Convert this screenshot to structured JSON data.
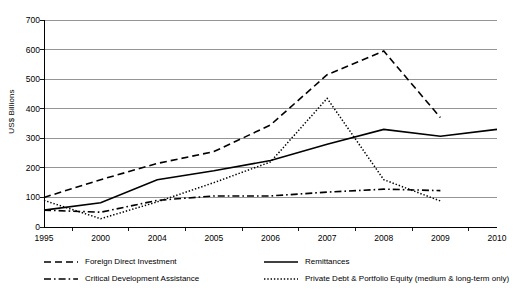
{
  "chart_data": {
    "type": "line",
    "title": "",
    "xlabel": "",
    "ylabel": "US$ Billions",
    "categories": [
      "1995",
      "2000",
      "2004",
      "2005",
      "2006",
      "2007",
      "2008",
      "2009",
      "2010"
    ],
    "ylim": [
      0,
      700
    ],
    "yticks": [
      0,
      100,
      200,
      300,
      400,
      500,
      600,
      700
    ],
    "grid": true,
    "legend_position": "bottom",
    "series": [
      {
        "name": "Foreign Direct Investment",
        "style": "dashed",
        "color": "#000000",
        "values": [
          100,
          160,
          215,
          255,
          345,
          515,
          595,
          370,
          null
        ]
      },
      {
        "name": "Remittances",
        "style": "solid",
        "color": "#000000",
        "values": [
          57,
          82,
          160,
          190,
          225,
          280,
          330,
          307,
          330
        ]
      },
      {
        "name": "Critical Development Assistance",
        "style": "dash-dot",
        "color": "#000000",
        "values": [
          57,
          50,
          90,
          105,
          105,
          118,
          128,
          123,
          null
        ]
      },
      {
        "name": "Private Debt & Portfolio Equity (medium & long-term only)",
        "style": "dotted",
        "color": "#000000",
        "values": [
          90,
          28,
          85,
          150,
          220,
          435,
          160,
          88,
          null
        ]
      }
    ]
  },
  "axis": {
    "y_title": "US$ Billions",
    "y_tick_labels": [
      "700",
      "600",
      "500",
      "400",
      "300",
      "200",
      "100",
      "0"
    ],
    "x_tick_labels": [
      "1995",
      "2000",
      "2004",
      "2005",
      "2006",
      "2007",
      "2008",
      "2009",
      "2010"
    ]
  },
  "legend": {
    "items": [
      {
        "label": "Foreign Direct Investment",
        "style": "dashed"
      },
      {
        "label": "Remittances",
        "style": "solid"
      },
      {
        "label": "Critical Development Assistance",
        "style": "dash-dot"
      },
      {
        "label": "Private Debt & Portfolio Equity (medium & long-term only)",
        "style": "dotted"
      }
    ]
  }
}
